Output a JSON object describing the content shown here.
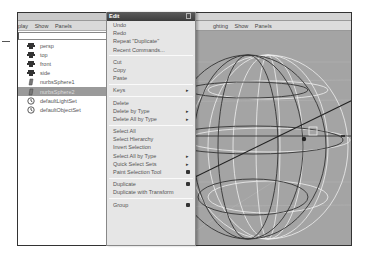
{
  "outliner": {
    "menu": [
      "play",
      "Show",
      "Panels"
    ],
    "filter_value": "",
    "items": [
      {
        "label": "persp",
        "icon": "camera-icon",
        "selected": false
      },
      {
        "label": "top",
        "icon": "camera-icon",
        "selected": false
      },
      {
        "label": "front",
        "icon": "camera-icon",
        "selected": false
      },
      {
        "label": "side",
        "icon": "camera-icon",
        "selected": false
      },
      {
        "label": "nurbsSphere1",
        "icon": "nurbs-icon",
        "selected": false
      },
      {
        "label": "nurbsSphere2",
        "icon": "nurbs-icon",
        "selected": true
      },
      {
        "label": "defaultLightSet",
        "icon": "set-icon",
        "selected": false
      },
      {
        "label": "defaultObjectSet",
        "icon": "set-icon",
        "selected": false
      }
    ]
  },
  "viewport": {
    "menu": [
      "ghting",
      "Show",
      "Panels"
    ]
  },
  "edit_menu": {
    "title": "Edit",
    "items": [
      {
        "label": "Undo"
      },
      {
        "label": "Redo"
      },
      {
        "label": "Repeat \"Duplicate\""
      },
      {
        "label": "Recent Commands..."
      },
      {
        "sep": true
      },
      {
        "label": "Cut"
      },
      {
        "label": "Copy"
      },
      {
        "label": "Paste"
      },
      {
        "sep": true
      },
      {
        "label": "Keys",
        "submenu": true
      },
      {
        "sep": true
      },
      {
        "label": "Delete"
      },
      {
        "label": "Delete by Type",
        "submenu": true
      },
      {
        "label": "Delete All by Type",
        "submenu": true
      },
      {
        "sep": true
      },
      {
        "label": "Select All"
      },
      {
        "label": "Select Hierarchy"
      },
      {
        "label": "Invert Selection"
      },
      {
        "label": "Select All by Type",
        "submenu": true
      },
      {
        "label": "Quick Select Sets",
        "submenu": true
      },
      {
        "label": "Paint Selection Tool",
        "option": true
      },
      {
        "sep": true
      },
      {
        "label": "Duplicate",
        "option": true
      },
      {
        "label": "Duplicate with Transform"
      },
      {
        "sep": true
      },
      {
        "label": "Group",
        "option": true
      }
    ]
  }
}
